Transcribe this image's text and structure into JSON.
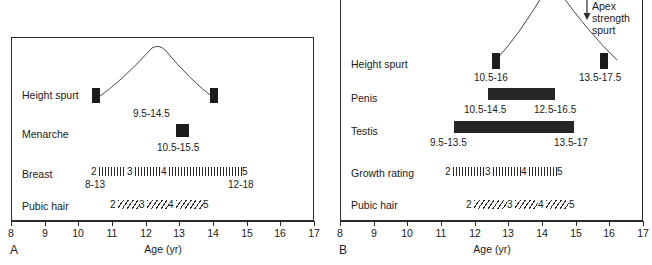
{
  "figure": {
    "title": "",
    "axis_title": "Age (yr)",
    "axis_ticks": [
      "8",
      "9",
      "10",
      "11",
      "12",
      "13",
      "14",
      "15",
      "16",
      "17"
    ],
    "axis_min": 8,
    "axis_max": 17,
    "ink_color": "#1c1c1c",
    "frame_color": "#2b2b2b"
  },
  "panel_a": {
    "letter": "A",
    "rows": [
      {
        "label": "Height spurt"
      },
      {
        "label": "Menarche"
      },
      {
        "label": "Breast"
      },
      {
        "label": "Pubic hair"
      }
    ],
    "height_spurt": {
      "label": "Height spurt",
      "onset_marker_age": 10.5,
      "apex_age": 12.1,
      "offset_marker_age": 14.0,
      "range_label": "9.5-14.5"
    },
    "menarche": {
      "label": "Menarche",
      "age": 13.0,
      "range_label": "10.5-15.5"
    },
    "breast": {
      "label": "Breast",
      "start_age": 10.5,
      "end_age": 15.0,
      "stage_labels": [
        "2",
        "3",
        "4",
        "5"
      ],
      "left_range_label": "8-13",
      "right_range_label": "12-18"
    },
    "pubic_hair": {
      "label": "Pubic hair",
      "start_age": 11.0,
      "end_age": 13.8,
      "stage_labels": [
        "2",
        "3",
        "4",
        "5"
      ]
    }
  },
  "panel_b": {
    "letter": "B",
    "rows": [
      {
        "label": "Height spurt"
      },
      {
        "label": "Penis"
      },
      {
        "label": "Testis"
      },
      {
        "label": "Growth rating"
      },
      {
        "label": "Pubic hair"
      }
    ],
    "annotation": {
      "line1": "Apex",
      "line2": "strength",
      "line3": "spurt",
      "arrow": "down-arrow-icon"
    },
    "height_spurt": {
      "label": "Height spurt",
      "onset_marker_age": 12.5,
      "apex_age": 14.0,
      "offset_marker_age": 15.8,
      "left_range_label": "10.5-16",
      "right_range_label": "13.5-17.5"
    },
    "penis": {
      "label": "Penis",
      "start_age": 12.5,
      "end_age": 14.4,
      "left_range_label": "10.5-14.5",
      "right_range_label": "12.5-16.5"
    },
    "testis": {
      "label": "Testis",
      "start_age": 11.5,
      "end_age": 15.0,
      "left_range_label": "9.5-13.5",
      "right_range_label": "13.5-17"
    },
    "growth_rating": {
      "label": "Growth rating",
      "start_age": 11.2,
      "end_age": 14.5,
      "stage_labels": [
        "2",
        "3",
        "4",
        "5"
      ]
    },
    "pubic_hair": {
      "label": "Pubic hair",
      "start_age": 11.8,
      "end_age": 15.0,
      "stage_labels": [
        "2",
        "3",
        "4",
        "5"
      ]
    }
  }
}
